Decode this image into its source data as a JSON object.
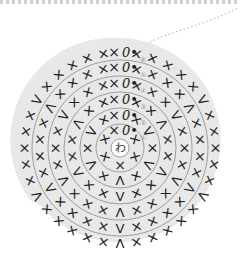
{
  "diagram": {
    "type": "crochet-chart",
    "center_label": "わ",
    "background_color": "#e8e8e8",
    "ring_color": "#8a8a8a",
    "symbol_color": "#222222",
    "rounds": [
      {
        "number": "①",
        "start_marker": "0•"
      },
      {
        "number": "②",
        "start_marker": "0•"
      },
      {
        "number": "③",
        "start_marker": "0•"
      },
      {
        "number": "④",
        "start_marker": "0•"
      },
      {
        "number": "⑤",
        "start_marker": "0•"
      },
      {
        "number": "⑥",
        "start_marker": "0•"
      }
    ],
    "symbols": {
      "single_crochet": "×",
      "increase": "V",
      "decrease": "Λ"
    }
  }
}
